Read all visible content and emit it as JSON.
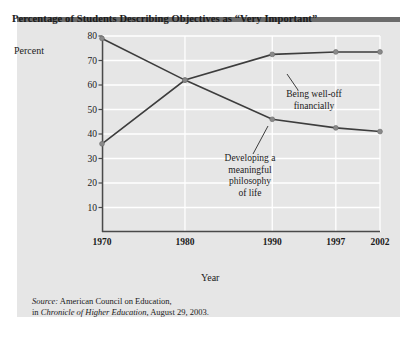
{
  "panel": {
    "title": "Percentage of Students Describing Objectives as “Very Important”",
    "background_color": "#e6e6e6",
    "top_bar_color": "#6b6b6b"
  },
  "source": {
    "prefix": "Source:",
    "line1_rest": " American Council on Education,",
    "line2_lead": "in ",
    "line2_italic": "Chronicle of Higher Education",
    "line2_rest": ", August 29, 2003."
  },
  "chart_data": {
    "type": "line",
    "title": "Percentage of Students Describing Objectives as “Very Important”",
    "xlabel": "Year",
    "ylabel": "Percent",
    "categories": [
      "1970",
      "1980",
      "1990",
      "1997",
      "2002"
    ],
    "x_positions": [
      0,
      77,
      158,
      217,
      258
    ],
    "ylim": [
      0,
      80
    ],
    "yticks": [
      10,
      20,
      30,
      40,
      50,
      60,
      70,
      80
    ],
    "grid": true,
    "gridline_color": "#ffffff",
    "legend_position": "inline-annotations",
    "line_color": "#3d3d3d",
    "marker_color": "#8a8a8a",
    "series": [
      {
        "name": "Developing a meaningful philosophy of life",
        "values": [
          79,
          62,
          46,
          42.5,
          41
        ],
        "annotation_lines": [
          "Developing a",
          "meaningful",
          "philosophy",
          "of life"
        ]
      },
      {
        "name": "Being well-off financially",
        "values": [
          36,
          62,
          72.5,
          73.5,
          73.5
        ],
        "annotation_lines": [
          "Being well-off",
          "financially"
        ]
      }
    ]
  }
}
